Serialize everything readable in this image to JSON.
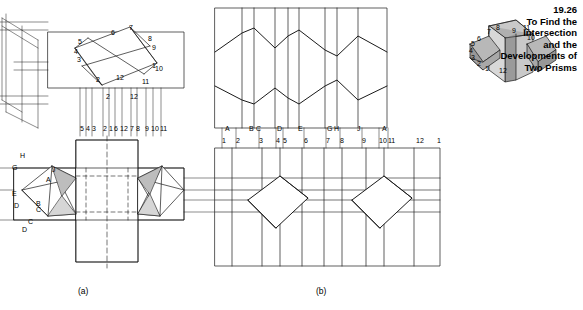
{
  "figure": {
    "number": "19.26",
    "title_lines": [
      "To Find the",
      "Intersection",
      "and the",
      "Developments of",
      "Two Prisms"
    ],
    "sublabels": [
      {
        "text": "(a)",
        "x": 84,
        "y": 292
      },
      {
        "text": "(b)",
        "x": 322,
        "y": 292
      }
    ]
  },
  "colors": {
    "line": "#1a1a1a",
    "paper": "#ffffff",
    "shade_light": "#c9c9c9",
    "shade_mid": "#a8a8a8",
    "shade_dark": "#8a8a8a"
  },
  "labels": {
    "top_view_ruler": [
      {
        "text": "5",
        "x": 80,
        "y": 131
      },
      {
        "text": "4",
        "x": 86,
        "y": 131
      },
      {
        "text": "3",
        "x": 92,
        "y": 131
      },
      {
        "text": "2",
        "x": 103,
        "y": 131
      },
      {
        "text": "1",
        "x": 109,
        "y": 131
      },
      {
        "text": "6",
        "x": 114,
        "y": 131
      },
      {
        "text": "12",
        "x": 120,
        "y": 131
      },
      {
        "text": "7",
        "x": 130,
        "y": 131
      },
      {
        "text": "8",
        "x": 136,
        "y": 131
      },
      {
        "text": "9",
        "x": 145,
        "y": 131
      },
      {
        "text": "10",
        "x": 151,
        "y": 131
      },
      {
        "text": "11",
        "x": 160,
        "y": 131
      }
    ],
    "dev_top_letters": [
      {
        "text": "A",
        "x": 225,
        "y": 131
      },
      {
        "text": "B",
        "x": 249,
        "y": 131
      },
      {
        "text": "C",
        "x": 256,
        "y": 131
      },
      {
        "text": "D",
        "x": 277,
        "y": 131
      },
      {
        "text": "E",
        "x": 298,
        "y": 131
      },
      {
        "text": "G",
        "x": 327,
        "y": 131
      },
      {
        "text": "H",
        "x": 334,
        "y": 131
      },
      {
        "text": "J",
        "x": 357,
        "y": 131
      },
      {
        "text": "A",
        "x": 382,
        "y": 131
      }
    ],
    "dev_bottom_numbers": [
      {
        "text": "1",
        "x": 222,
        "y": 143
      },
      {
        "text": "2",
        "x": 236,
        "y": 143
      },
      {
        "text": "3",
        "x": 259,
        "y": 143
      },
      {
        "text": "4",
        "x": 276,
        "y": 143
      },
      {
        "text": "5",
        "x": 283,
        "y": 143
      },
      {
        "text": "6",
        "x": 304,
        "y": 143
      },
      {
        "text": "7",
        "x": 326,
        "y": 143
      },
      {
        "text": "8",
        "x": 340,
        "y": 143
      },
      {
        "text": "9",
        "x": 362,
        "y": 143
      },
      {
        "text": "10",
        "x": 379,
        "y": 143
      },
      {
        "text": "11",
        "x": 388,
        "y": 143
      },
      {
        "text": "12",
        "x": 416,
        "y": 143
      },
      {
        "text": "1",
        "x": 437,
        "y": 143
      }
    ],
    "front_view_upper": [
      {
        "text": "5",
        "x": 78,
        "y": 44
      },
      {
        "text": "6",
        "x": 111,
        "y": 35
      },
      {
        "text": "7",
        "x": 129,
        "y": 30
      },
      {
        "text": "4",
        "x": 74,
        "y": 54
      },
      {
        "text": "8",
        "x": 148,
        "y": 41
      },
      {
        "text": "9",
        "x": 152,
        "y": 50
      },
      {
        "text": "3",
        "x": 77,
        "y": 62
      },
      {
        "text": "1",
        "x": 152,
        "y": 68
      },
      {
        "text": "10",
        "x": 155,
        "y": 71
      },
      {
        "text": "2",
        "x": 96,
        "y": 82
      },
      {
        "text": "12",
        "x": 116,
        "y": 80
      },
      {
        "text": "11",
        "x": 142,
        "y": 84
      },
      {
        "text": "2",
        "x": 106,
        "y": 99
      },
      {
        "text": "12",
        "x": 130,
        "y": 99
      }
    ],
    "side_view_left": [
      {
        "text": "H",
        "x": 20,
        "y": 158
      },
      {
        "text": "G",
        "x": 12,
        "y": 170
      },
      {
        "text": "J",
        "x": 52,
        "y": 172
      },
      {
        "text": "A",
        "x": 46,
        "y": 182
      },
      {
        "text": "E",
        "x": 12,
        "y": 196
      },
      {
        "text": "D",
        "x": 14,
        "y": 208
      },
      {
        "text": "C",
        "x": 36,
        "y": 212
      },
      {
        "text": "B",
        "x": 36,
        "y": 206
      },
      {
        "text": "C",
        "x": 28,
        "y": 224
      },
      {
        "text": "D",
        "x": 22,
        "y": 232
      }
    ],
    "pictorial_small": [
      {
        "text": "7",
        "x": 487,
        "y": 34
      },
      {
        "text": "8",
        "x": 496,
        "y": 30
      },
      {
        "text": "9",
        "x": 512,
        "y": 33
      },
      {
        "text": "11",
        "x": 523,
        "y": 30
      },
      {
        "text": "6",
        "x": 477,
        "y": 41
      },
      {
        "text": "5",
        "x": 471,
        "y": 46
      },
      {
        "text": "4",
        "x": 469,
        "y": 53
      },
      {
        "text": "10",
        "x": 527,
        "y": 40
      },
      {
        "text": "3",
        "x": 471,
        "y": 60
      },
      {
        "text": "2",
        "x": 477,
        "y": 66
      },
      {
        "text": "1",
        "x": 485,
        "y": 71
      },
      {
        "text": "12",
        "x": 499,
        "y": 73
      }
    ]
  },
  "chart_data": {
    "type": "diagram"
  }
}
